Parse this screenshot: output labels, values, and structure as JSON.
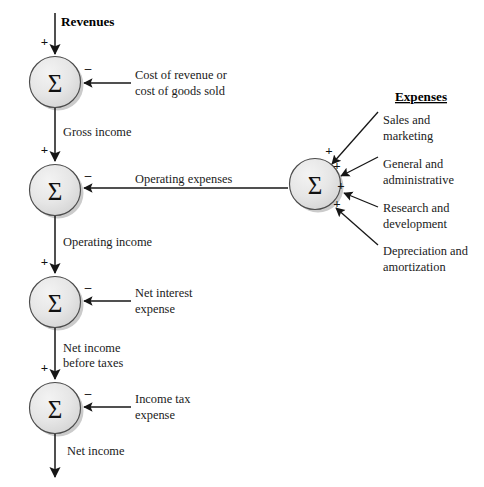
{
  "diagram": {
    "background_color": "#ffffff",
    "line_color": "#161616",
    "node_fill_color": "#e3e3e3",
    "node_stroke_color": "#4b4b4b",
    "sigma_symbol": "Σ",
    "sign_plus": "+",
    "sign_minus": "–"
  },
  "headings": {
    "expenses": "Expenses"
  },
  "flow_labels": {
    "revenues": "Revenues",
    "gross_income": "Gross income",
    "operating_income": "Operating income",
    "net_income_before_taxes_line1": "Net income",
    "net_income_before_taxes_line2": "before taxes",
    "net_income": "Net income",
    "operating_expenses": "Operating expenses"
  },
  "deductions": [
    {
      "id": "cost-of-revenue",
      "line1": "Cost of revenue or",
      "line2": "cost of goods sold",
      "sign": "–"
    },
    {
      "id": "net-interest-expense",
      "line1": "Net interest",
      "line2": "expense",
      "sign": "–"
    },
    {
      "id": "income-tax-expense",
      "line1": "Income tax",
      "line2": "expense",
      "sign": "–"
    }
  ],
  "expense_inputs": [
    {
      "id": "sales-and-marketing",
      "line1": "Sales and",
      "line2": "marketing",
      "sign": "+"
    },
    {
      "id": "general-and-administrative",
      "line1": "General and",
      "line2": "administrative",
      "sign": "+"
    },
    {
      "id": "research-and-development",
      "line1": "Research and",
      "line2": "development",
      "sign": "+"
    },
    {
      "id": "depreciation-and-amortization",
      "line1": "Depreciation and",
      "line2": "amortization",
      "sign": "+"
    }
  ],
  "nodes": [
    {
      "id": "gross-income-node",
      "symbol": "Σ",
      "input_sign": "+",
      "deduction_sign": "–"
    },
    {
      "id": "operating-income-node",
      "symbol": "Σ",
      "input_sign": "+",
      "deduction_sign": "–"
    },
    {
      "id": "pretax-income-node",
      "symbol": "Σ",
      "input_sign": "+",
      "deduction_sign": "–"
    },
    {
      "id": "net-income-node",
      "symbol": "Σ",
      "input_sign": "+",
      "deduction_sign": "–"
    },
    {
      "id": "total-expenses-node",
      "symbol": "Σ"
    }
  ]
}
